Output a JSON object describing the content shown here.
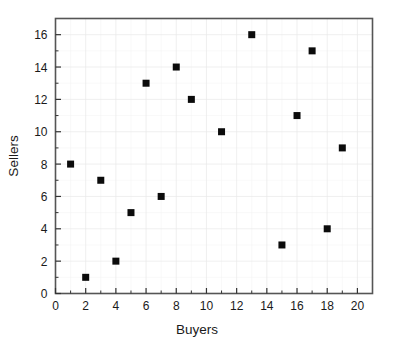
{
  "chart_data": {
    "type": "scatter",
    "title": "",
    "xlabel": "Buyers",
    "ylabel": "Sellers",
    "xlim": [
      0,
      21
    ],
    "ylim": [
      0,
      17
    ],
    "xticks": [
      0,
      2,
      4,
      6,
      8,
      10,
      12,
      14,
      16,
      18,
      20
    ],
    "yticks": [
      0,
      2,
      4,
      6,
      8,
      10,
      12,
      14,
      16
    ],
    "xtick_labels": [
      "0",
      "2",
      "4",
      "6",
      "8",
      "10",
      "12",
      "14",
      "16",
      "18",
      "20"
    ],
    "ytick_labels": [
      "0",
      "2",
      "4",
      "6",
      "8",
      "10",
      "12",
      "14",
      "16"
    ],
    "x_minor_ticks": [
      1,
      3,
      5,
      7,
      9,
      11,
      13,
      15,
      17,
      19
    ],
    "y_minor_ticks": [
      1,
      3,
      5,
      7,
      9,
      11,
      13,
      15
    ],
    "grid": true,
    "legend": null,
    "marker": "square",
    "marker_color": "#0b0b0b",
    "marker_size": 7,
    "x": [
      1,
      2,
      3,
      4,
      5,
      6,
      7,
      8,
      9,
      11,
      13,
      15,
      16,
      17,
      18,
      19
    ],
    "y": [
      8,
      1,
      7,
      2,
      5,
      13,
      6,
      14,
      12,
      10,
      16,
      3,
      11,
      15,
      4,
      9
    ],
    "points": [
      {
        "x": 1,
        "y": 8
      },
      {
        "x": 2,
        "y": 1
      },
      {
        "x": 3,
        "y": 7
      },
      {
        "x": 4,
        "y": 2
      },
      {
        "x": 5,
        "y": 5
      },
      {
        "x": 6,
        "y": 13
      },
      {
        "x": 7,
        "y": 6
      },
      {
        "x": 8,
        "y": 14
      },
      {
        "x": 9,
        "y": 12
      },
      {
        "x": 11,
        "y": 10
      },
      {
        "x": 13,
        "y": 16
      },
      {
        "x": 15,
        "y": 3
      },
      {
        "x": 16,
        "y": 11
      },
      {
        "x": 17,
        "y": 15
      },
      {
        "x": 18,
        "y": 4
      },
      {
        "x": 19,
        "y": 9
      }
    ],
    "colors": {
      "background": "#ffffff",
      "frame": "#555555",
      "grid": "#e8e8e8",
      "text": "#1a1a1a",
      "marker": "#0b0b0b"
    }
  }
}
